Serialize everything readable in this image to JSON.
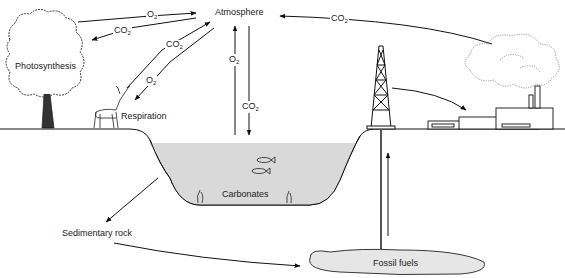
{
  "diagram": {
    "nodes": {
      "atmosphere": "Atmosphere",
      "photosynthesis": "Photosynthesis",
      "respiration": "Respiration",
      "carbonates": "Carbonates",
      "sedimentary_rock": "Sedimentary rock",
      "fossil_fuels": "Fossil fuels"
    },
    "flows": [
      {
        "id": "tree-to-atm",
        "from": "Photosynthesis (tree)",
        "to": "Atmosphere",
        "label": "O",
        "sub": "2"
      },
      {
        "id": "atm-to-tree",
        "from": "Atmosphere",
        "to": "Photosynthesis (tree)",
        "label": "CO",
        "sub": "2"
      },
      {
        "id": "deer-to-atm",
        "from": "Respiration (deer)",
        "to": "Atmosphere",
        "label": "CO",
        "sub": "2"
      },
      {
        "id": "atm-to-deer",
        "from": "Atmosphere",
        "to": "Respiration (deer)",
        "label": "O",
        "sub": "2"
      },
      {
        "id": "water-to-atm",
        "from": "Water",
        "to": "Atmosphere",
        "label": "O",
        "sub": "2"
      },
      {
        "id": "atm-to-water",
        "from": "Atmosphere",
        "to": "Water",
        "label": "CO",
        "sub": "2"
      },
      {
        "id": "factory-to-atm",
        "from": "Factory smoke",
        "to": "Atmosphere",
        "label": "CO",
        "sub": "2"
      },
      {
        "id": "derrick-to-factory",
        "from": "Oil derrick",
        "to": "Factory",
        "label": ""
      },
      {
        "id": "water-to-rock",
        "from": "Carbonates",
        "to": "Sedimentary rock",
        "label": ""
      },
      {
        "id": "rock-to-fuel",
        "from": "Sedimentary rock",
        "to": "Fossil fuels",
        "label": ""
      },
      {
        "id": "fuel-to-derrick",
        "from": "Fossil fuels",
        "to": "Oil derrick",
        "label": ""
      }
    ],
    "colors": {
      "line": "#111111",
      "water": "#d9d9d9",
      "fuel": "#e6e6e6",
      "text": "#222222"
    }
  }
}
